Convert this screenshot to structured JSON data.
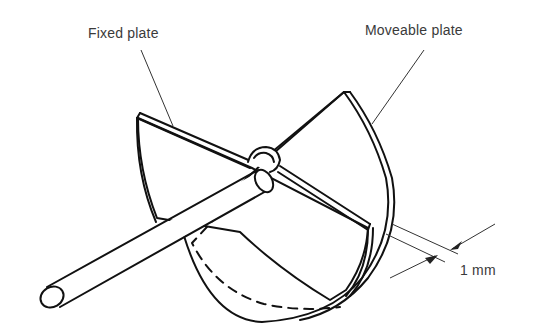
{
  "figure": {
    "labels": {
      "fixed_plate": "Fixed plate",
      "moveable_plate": "Moveable plate",
      "gap_dimension": "1 mm"
    },
    "parts": [
      {
        "name": "fixed-plate",
        "description": "semicircular fixed plate"
      },
      {
        "name": "moveable-plate",
        "description": "semicircular moveable plate rotating on shaft"
      },
      {
        "name": "shaft",
        "description": "cylindrical spindle through hub"
      },
      {
        "name": "hub",
        "description": "pivot hub at plate centre"
      }
    ],
    "colors": {
      "line": "#111111",
      "text": "#3a3a3a",
      "background": "#ffffff"
    }
  }
}
